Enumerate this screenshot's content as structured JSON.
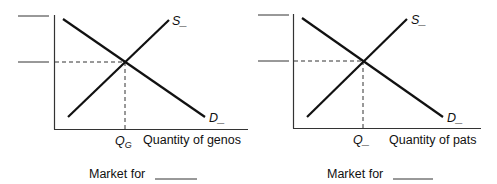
{
  "diagrams": [
    {
      "id": "left",
      "supply_label": "S",
      "supply_blank": "_",
      "demand_label": "D",
      "demand_blank": "_",
      "quantity_label": "Q",
      "quantity_subscript": "G",
      "x_axis_label": "Quantity of genos",
      "caption": "Market for",
      "caption_blank": "______"
    },
    {
      "id": "right",
      "supply_label": "S",
      "supply_blank": "_",
      "demand_label": "D",
      "demand_blank": "_",
      "quantity_label": "Q",
      "quantity_subscript": "_",
      "x_axis_label": "Quantity of pats",
      "caption": "Market for",
      "caption_blank": "______"
    }
  ],
  "colors": {
    "line": "#111111",
    "axis": "#333333",
    "dash": "#333333"
  }
}
